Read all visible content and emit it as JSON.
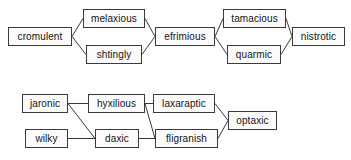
{
  "diagram": {
    "type": "node-link-diagram",
    "background_color": "#ffffff",
    "node_fill_color": "#fbfbfb",
    "node_border_color": "#3a3a3a",
    "edge_color": "#3a3a3a",
    "text_color": "#141414",
    "clusters": [
      {
        "id": "cluster-top",
        "nodes": [
          {
            "id": "cromulent",
            "label": "cromulent",
            "x": 8,
            "y": 27,
            "w": 64,
            "h": 19
          },
          {
            "id": "melaxious",
            "label": "melaxious",
            "x": 83,
            "y": 9,
            "w": 62,
            "h": 19
          },
          {
            "id": "shtingly",
            "label": "shtingly",
            "x": 86,
            "y": 45,
            "w": 56,
            "h": 19
          },
          {
            "id": "efrimious",
            "label": "efrimious",
            "x": 155,
            "y": 27,
            "w": 60,
            "h": 19
          },
          {
            "id": "tamacious",
            "label": "tamacious",
            "x": 223,
            "y": 9,
            "w": 63,
            "h": 19
          },
          {
            "id": "quarmic",
            "label": "quarmic",
            "x": 227,
            "y": 45,
            "w": 54,
            "h": 19
          },
          {
            "id": "nistrotic",
            "label": "nistrotic",
            "x": 292,
            "y": 27,
            "w": 53,
            "h": 19
          }
        ],
        "edges": [
          {
            "from": "cromulent",
            "to": "melaxious"
          },
          {
            "from": "cromulent",
            "to": "shtingly"
          },
          {
            "from": "melaxious",
            "to": "efrimious"
          },
          {
            "from": "shtingly",
            "to": "efrimious"
          },
          {
            "from": "efrimious",
            "to": "tamacious"
          },
          {
            "from": "efrimious",
            "to": "quarmic"
          },
          {
            "from": "tamacious",
            "to": "nistrotic"
          },
          {
            "from": "quarmic",
            "to": "nistrotic"
          }
        ]
      },
      {
        "id": "cluster-bottom",
        "nodes": [
          {
            "id": "jaronic",
            "label": "jaronic",
            "x": 22,
            "y": 94,
            "w": 46,
            "h": 19
          },
          {
            "id": "hyxilious",
            "label": "hyxilious",
            "x": 88,
            "y": 94,
            "w": 57,
            "h": 19
          },
          {
            "id": "laxaraptic",
            "label": "laxaraptic",
            "x": 153,
            "y": 94,
            "w": 62,
            "h": 19
          },
          {
            "id": "wilky",
            "label": "wilky",
            "x": 25,
            "y": 129,
            "w": 43,
            "h": 19
          },
          {
            "id": "daxic",
            "label": "daxic",
            "x": 95,
            "y": 129,
            "w": 44,
            "h": 19
          },
          {
            "id": "fligranish",
            "label": "fligranish",
            "x": 155,
            "y": 129,
            "w": 63,
            "h": 19
          },
          {
            "id": "optaxic",
            "label": "optaxic",
            "x": 228,
            "y": 111,
            "w": 49,
            "h": 19
          }
        ],
        "edges": [
          {
            "from": "jaronic",
            "to": "hyxilious"
          },
          {
            "from": "jaronic",
            "to": "daxic"
          },
          {
            "from": "wilky",
            "to": "daxic"
          },
          {
            "from": "hyxilious",
            "to": "laxaraptic"
          },
          {
            "from": "hyxilious",
            "to": "fligranish"
          },
          {
            "from": "daxic",
            "to": "fligranish"
          },
          {
            "from": "laxaraptic",
            "to": "optaxic"
          },
          {
            "from": "fligranish",
            "to": "optaxic"
          }
        ]
      }
    ]
  }
}
